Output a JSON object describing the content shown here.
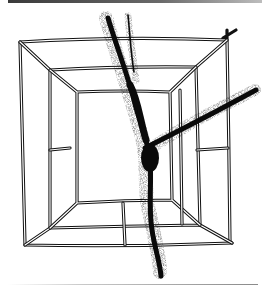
{
  "figure": {
    "colors": {
      "background": "#ffffff",
      "ink": "#111111",
      "top_bar_dark": "#3a3a3a",
      "top_bar_light": "#bdbdbd",
      "bottom_rule": "#8a8a8a"
    },
    "frame": {
      "outer": {
        "tl": [
          20,
          42
        ],
        "tr": [
          227,
          40
        ],
        "br": [
          232,
          243
        ],
        "bl": [
          25,
          245
        ]
      },
      "middle": {
        "tl": [
          50,
          70
        ],
        "tr": [
          196,
          67
        ],
        "br": [
          200,
          225
        ],
        "bl": [
          50,
          228
        ]
      },
      "inner": {
        "tl": [
          77,
          92
        ],
        "tr": [
          170,
          92
        ],
        "br": [
          172,
          200
        ],
        "bl": [
          77,
          203
        ]
      }
    },
    "branch": {
      "trunk": [
        [
          110,
          18
        ],
        [
          135,
          100
        ],
        [
          148,
          150
        ],
        [
          150,
          200
        ],
        [
          160,
          270
        ]
      ],
      "upper_left_twig": [
        [
          128,
          15
        ],
        [
          130,
          40
        ],
        [
          134,
          70
        ]
      ],
      "right_limb": [
        [
          150,
          150
        ],
        [
          185,
          130
        ],
        [
          215,
          112
        ],
        [
          255,
          92
        ]
      ]
    }
  }
}
